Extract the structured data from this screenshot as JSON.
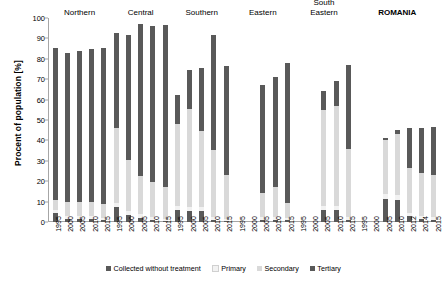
{
  "chart_data": {
    "type": "bar",
    "title": "",
    "subtitle": "",
    "xlabel": "",
    "ylabel": "Procent of population [%]",
    "ylim": [
      0,
      100
    ],
    "yticks": [
      0,
      10,
      20,
      30,
      40,
      50,
      60,
      70,
      80,
      90,
      100
    ],
    "grid": false,
    "stacked": true,
    "legend_position": "bottom",
    "series": [
      {
        "name": "Collected without treatment",
        "color": "#595959"
      },
      {
        "name": "Primary",
        "color": "#f2f2f2"
      },
      {
        "name": "Secondary",
        "color": "#d9d9d9"
      },
      {
        "name": "Tertiary",
        "color": "#595959"
      }
    ],
    "groups": [
      {
        "name": "Northern",
        "bold": false,
        "categories": [
          "1995",
          "2000",
          "2005",
          "2010",
          "2015"
        ],
        "bars": [
          {
            "x": "1995",
            "values": [
              4.5,
              1.5,
              5.0,
              74.5
            ],
            "total": 85.5
          },
          {
            "x": "2000",
            "values": [
              1.5,
              1.5,
              7.0,
              73.0
            ],
            "total": 83.0
          },
          {
            "x": "2005",
            "values": [
              1.5,
              1.5,
              7.0,
              74.0
            ],
            "total": 84.0
          },
          {
            "x": "2010",
            "values": [
              1.5,
              1.5,
              7.0,
              75.0
            ],
            "total": 85.0
          },
          {
            "x": "2015",
            "values": [
              1.0,
              1.0,
              7.0,
              76.5
            ],
            "total": 85.5
          }
        ]
      },
      {
        "name": "Central",
        "bold": false,
        "categories": [
          "1995",
          "2000",
          "2005",
          "2010",
          "2015"
        ],
        "bars": [
          {
            "x": "1995",
            "values": [
              7.5,
              2.0,
              36.5,
              46.5
            ],
            "total": 92.5
          },
          {
            "x": "2000",
            "values": [
              3.5,
              2.0,
              25.0,
              61.0
            ],
            "total": 91.5
          },
          {
            "x": "2005",
            "values": [
              2.0,
              2.0,
              18.5,
              74.5
            ],
            "total": 97.0
          },
          {
            "x": "2010",
            "values": [
              1.0,
              1.5,
              17.0,
              76.5
            ],
            "total": 96.0
          },
          {
            "x": "2015",
            "values": [
              0.5,
              1.0,
              15.5,
              79.5
            ],
            "total": 96.5
          }
        ]
      },
      {
        "name": "Southern",
        "bold": false,
        "categories": [
          "1995",
          "2000",
          "2005",
          "2010",
          "2015"
        ],
        "bars": [
          {
            "x": "1995",
            "values": [
              6.0,
              2.0,
              40.0,
              14.5
            ],
            "total": 62.5
          },
          {
            "x": "2000",
            "values": [
              5.5,
              2.0,
              48.0,
              19.0
            ],
            "total": 74.5
          },
          {
            "x": "2005",
            "values": [
              5.5,
              2.0,
              37.0,
              31.0
            ],
            "total": 75.5
          },
          {
            "x": "2010",
            "values": [
              1.0,
              1.5,
              33.0,
              56.0
            ],
            "total": 91.5
          },
          {
            "x": "2015",
            "values": [
              0.5,
              1.0,
              21.5,
              53.5
            ],
            "total": 76.5
          }
        ]
      },
      {
        "name": "Eastern",
        "bold": false,
        "categories": [
          "1995",
          "2000",
          "2005",
          "2010",
          "2015"
        ],
        "bars": [
          {
            "x": "1995",
            "values": [
              0,
              0,
              0,
              0
            ],
            "total": 0
          },
          {
            "x": "2000",
            "values": [
              0,
              0,
              0,
              0
            ],
            "total": 0
          },
          {
            "x": "2005",
            "values": [
              1.0,
              1.5,
              11.5,
              53.0
            ],
            "total": 67.0
          },
          {
            "x": "2010",
            "values": [
              1.0,
              1.5,
              14.5,
              54.0
            ],
            "total": 71.0
          },
          {
            "x": "2015",
            "values": [
              1.0,
              1.0,
              7.5,
              68.5
            ],
            "total": 78.0
          }
        ]
      },
      {
        "name": "South\nEastern",
        "bold": false,
        "categories": [
          "1995",
          "2000",
          "2005",
          "2010",
          "2015"
        ],
        "bars": [
          {
            "x": "1995",
            "values": [
              0,
              0,
              0,
              0
            ],
            "total": 0
          },
          {
            "x": "2000",
            "values": [
              0,
              0,
              0,
              0
            ],
            "total": 0
          },
          {
            "x": "2005",
            "values": [
              6.0,
              2.0,
              47.0,
              9.0
            ],
            "total": 64.0
          },
          {
            "x": "2010",
            "values": [
              6.0,
              2.0,
              49.0,
              12.0
            ],
            "total": 69.0
          },
          {
            "x": "2015",
            "values": [
              1.0,
              1.5,
              33.5,
              41.0
            ],
            "total": 77.0
          }
        ]
      },
      {
        "name": "ROMANIA",
        "bold": true,
        "categories": [
          "1995",
          "2000",
          "2005",
          "2010",
          "2012",
          "2014",
          "2015"
        ],
        "bars": [
          {
            "x": "1995",
            "values": [
              0,
              0,
              0,
              0
            ],
            "total": 0
          },
          {
            "x": "2000",
            "values": [
              0,
              0,
              0,
              0
            ],
            "total": 0
          },
          {
            "x": "2005",
            "values": [
              11.5,
              2.0,
              26.5,
              1.0
            ],
            "total": 41.0
          },
          {
            "x": "2010",
            "values": [
              11.0,
              2.0,
              30.0,
              2.0
            ],
            "total": 45.0
          },
          {
            "x": "2012",
            "values": [
              3.0,
              1.5,
              22.0,
              19.5
            ],
            "total": 46.0
          },
          {
            "x": "2014",
            "values": [
              1.5,
              1.5,
              21.0,
              22.0
            ],
            "total": 46.0
          },
          {
            "x": "2015",
            "values": [
              1.0,
              1.5,
              20.5,
              23.5
            ],
            "total": 46.5
          }
        ]
      }
    ]
  },
  "legend": {
    "items": [
      {
        "label": "Collected without treatment",
        "color": "#595959"
      },
      {
        "label": "Primary",
        "color": "#f2f2f2"
      },
      {
        "label": "Secondary",
        "color": "#d9d9d9"
      },
      {
        "label": "Tertiary",
        "color": "#595959"
      }
    ]
  }
}
